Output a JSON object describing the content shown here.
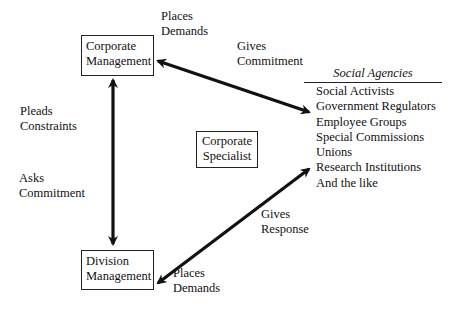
{
  "diagram": {
    "nodes": {
      "corporate_management": {
        "line1": "Corporate",
        "line2": "Management"
      },
      "division_management": {
        "line1": "Division",
        "line2": "Management"
      },
      "corporate_specialist": {
        "line1": "Corporate",
        "line2": "Specialist"
      }
    },
    "edge_labels": {
      "places_demands_top": {
        "line1": "Places",
        "line2": "Demands"
      },
      "gives_commitment": {
        "line1": "Gives",
        "line2": "Commitment"
      },
      "pleads_constraints": {
        "line1": "Pleads",
        "line2": "Constraints"
      },
      "asks_commitment": {
        "line1": "Asks",
        "line2": "Commitment"
      },
      "gives_response": {
        "line1": "Gives",
        "line2": "Response"
      },
      "places_demands_bottom": {
        "line1": "Places",
        "line2": "Demands"
      }
    },
    "social_agencies": {
      "title": "Social Agencies",
      "items": [
        "Social Activists",
        "Government Regulators",
        "Employee Groups",
        "Special Commissions",
        "Unions",
        "Research Institutions",
        "And the like"
      ]
    },
    "edges": [
      {
        "from": "Corporate Management",
        "to": "Division Management",
        "type": "bidirectional"
      },
      {
        "from": "Corporate Management",
        "to": "Social Agencies",
        "type": "bidirectional"
      },
      {
        "from": "Division Management",
        "to": "Social Agencies",
        "type": "bidirectional"
      }
    ]
  }
}
